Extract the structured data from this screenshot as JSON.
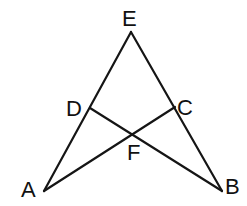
{
  "diagram": {
    "type": "geometry",
    "points": {
      "E": {
        "label": "E",
        "x": 131,
        "y": 32
      },
      "D": {
        "label": "D",
        "x": 90,
        "y": 108
      },
      "C": {
        "label": "C",
        "x": 175,
        "y": 107
      },
      "F": {
        "label": "F",
        "x": 133,
        "y": 134
      },
      "A": {
        "label": "A",
        "x": 44,
        "y": 191
      },
      "B": {
        "label": "B",
        "x": 222,
        "y": 191
      }
    },
    "segments": [
      "AE",
      "BE",
      "AC",
      "BD"
    ],
    "labels": {
      "E": "E",
      "D": "D",
      "C": "C",
      "F": "F",
      "A": "A",
      "B": "B"
    }
  }
}
